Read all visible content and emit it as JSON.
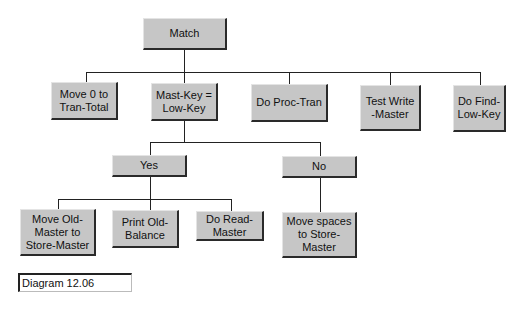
{
  "diagram": {
    "root": {
      "label": "Match"
    },
    "level1": [
      {
        "label": "Move 0 to\nTran-Total"
      },
      {
        "label": "Mast-Key =\nLow-Key"
      },
      {
        "label": "Do Proc-Tran"
      },
      {
        "label": "Test Write\n-Master"
      },
      {
        "label": "Do Find-\nLow-Key"
      }
    ],
    "condition": [
      {
        "label": "Yes"
      },
      {
        "label": "No"
      }
    ],
    "yes_children": [
      {
        "label": "Move Old-\nMaster to\nStore-Master"
      },
      {
        "label": "Print Old-\nBalance"
      },
      {
        "label": "Do Read-\nMaster"
      }
    ],
    "no_children": [
      {
        "label": "Move spaces\nto Store-\nMaster"
      }
    ],
    "caption": "Diagram 12.06"
  }
}
